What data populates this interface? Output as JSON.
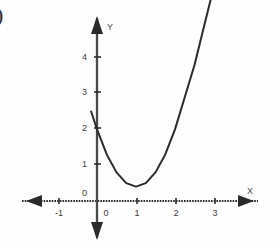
{
  "figure": {
    "corner_mark": ")",
    "background_color": "#fefefe",
    "ink_color": "#2b2b2b",
    "tick_label_color": "#3a3a3a"
  },
  "chart_data": {
    "type": "line",
    "title": "",
    "subtitle": "",
    "xlabel": "X",
    "ylabel": "Y",
    "grid": false,
    "legend": "none",
    "annotations": [],
    "xlim": [
      -1.6,
      3.5
    ],
    "ylim": [
      -0.6,
      5.4
    ],
    "x_ticks": [
      -1,
      0,
      1,
      2,
      3
    ],
    "x_tick_labels": [
      "-1",
      "0",
      "1",
      "2",
      "3"
    ],
    "y_ticks": [
      0,
      1,
      2,
      3,
      4
    ],
    "y_tick_labels": [
      "0",
      "1",
      "2",
      "3",
      "4"
    ],
    "origin_label": "0",
    "axis_arrows": [
      "left",
      "right",
      "up",
      "down"
    ],
    "series": [
      {
        "name": "parabola",
        "equation": "y = 1.6(x - 1)^2 + 0.4",
        "vertex": [
          1,
          0.4
        ],
        "y_intercept": 2,
        "color": "#2b2b2b",
        "x": [
          -0.15,
          0.0,
          0.25,
          0.5,
          0.75,
          1.0,
          1.25,
          1.5,
          1.75,
          2.0,
          2.25,
          2.5,
          2.75,
          3.0,
          3.2
        ],
        "values": [
          2.5,
          2.0,
          1.3,
          0.8,
          0.5,
          0.4,
          0.5,
          0.8,
          1.3,
          2.0,
          2.9,
          3.8,
          4.9,
          6.0,
          6.9
        ]
      }
    ]
  }
}
